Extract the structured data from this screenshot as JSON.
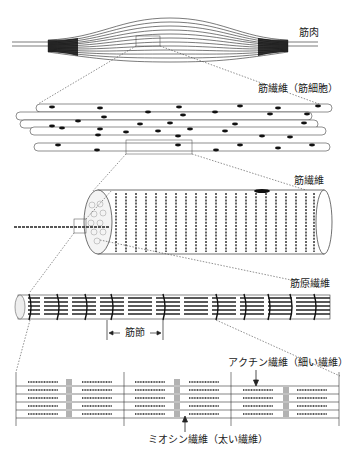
{
  "labels": {
    "muscle": "筋肉",
    "muscle_fiber_cell": "筋繊維（筋細胞）",
    "muscle_fiber": "筋繊維",
    "myofibril": "筋原繊維",
    "sarcomere": "筋節",
    "actin": "アクチン繊維（細い繊維）",
    "myosin": "ミオシン繊維（太い繊維）"
  },
  "colors": {
    "line": "#222222",
    "dotted": "#444444",
    "background": "#ffffff"
  }
}
